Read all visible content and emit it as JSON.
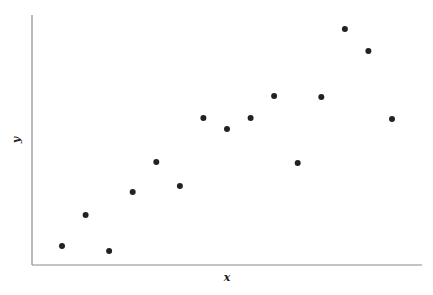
{
  "chart_data": {
    "type": "scatter",
    "title": "",
    "xlabel": "x",
    "ylabel": "y",
    "grid": false,
    "legend": null,
    "axis_ticks": "none",
    "xlim": [
      0,
      16.5
    ],
    "ylim": [
      0,
      25
    ],
    "x": [
      1,
      2,
      3,
      4,
      5,
      6,
      7,
      8,
      9,
      10,
      11,
      12,
      13,
      14,
      15
    ],
    "y": [
      1.9,
      5.0,
      1.4,
      7.3,
      10.3,
      7.9,
      14.7,
      13.6,
      14.7,
      16.9,
      10.2,
      16.8,
      23.6,
      21.4,
      14.6
    ],
    "marker_color": "#222222",
    "axis_color": "#888888"
  }
}
